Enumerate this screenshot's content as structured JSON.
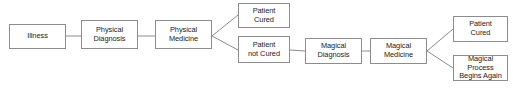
{
  "diagram": {
    "background_color": "#ffffff",
    "border_color": "#8c8c8c",
    "line_color": "#8c8c8c",
    "text_color": "#1a1a1a",
    "nodes": [
      {
        "id": "illness",
        "label": "Illness",
        "x": 9,
        "y": 24,
        "w": 57,
        "h": 25
      },
      {
        "id": "physical_diag",
        "label": "Physical\nDiagnosis",
        "x": 81,
        "y": 20,
        "w": 57,
        "h": 29
      },
      {
        "id": "physical_med",
        "label": "Physical\nMedicine",
        "x": 155,
        "y": 20,
        "w": 57,
        "h": 29
      },
      {
        "id": "patient_cured_1",
        "label": "Patient\nCured",
        "x": 238,
        "y": 3,
        "w": 52,
        "h": 25
      },
      {
        "id": "patient_not_cured",
        "label": "Patient\nnot Cured",
        "x": 238,
        "y": 36,
        "w": 52,
        "h": 27
      },
      {
        "id": "magical_diag",
        "label": "Magical\nDiagnosis",
        "x": 305,
        "y": 38,
        "w": 57,
        "h": 26
      },
      {
        "id": "magical_med",
        "label": "Magical\nMedicine",
        "x": 370,
        "y": 38,
        "w": 57,
        "h": 26
      },
      {
        "id": "patient_cured_2",
        "label": "Patient\nCured",
        "x": 453,
        "y": 16,
        "w": 55,
        "h": 26
      },
      {
        "id": "magical_again",
        "label": "Magical Process\nBegins Again",
        "x": 453,
        "y": 55,
        "w": 55,
        "h": 26
      }
    ],
    "edges": [
      {
        "id": "illness-to-physical-diagnosis",
        "from": "illness",
        "to": "physical_diag",
        "points": "66,36 81,36"
      },
      {
        "id": "physical-diagnosis-to-medicine",
        "from": "physical_diag",
        "to": "physical_med",
        "points": "138,36 155,36"
      },
      {
        "id": "physical-medicine-to-patient-cured",
        "from": "physical_med",
        "to": "patient_cured_1",
        "points": "212,36 238,15"
      },
      {
        "id": "physical-medicine-to-not-cured",
        "from": "physical_med",
        "to": "patient_not_cured",
        "points": "212,36 238,50"
      },
      {
        "id": "not-cured-to-magical-diagnosis",
        "from": "patient_not_cured",
        "to": "magical_diag",
        "points": "290,50 305,51"
      },
      {
        "id": "magical-diagnosis-to-magical-medicine",
        "from": "magical_diag",
        "to": "magical_med",
        "points": "362,51 370,51"
      },
      {
        "id": "magical-medicine-to-patient-cured",
        "from": "magical_med",
        "to": "patient_cured_2",
        "points": "427,51 453,29"
      },
      {
        "id": "magical-medicine-to-begins-again",
        "from": "magical_med",
        "to": "magical_again",
        "points": "427,51 453,68"
      }
    ]
  }
}
